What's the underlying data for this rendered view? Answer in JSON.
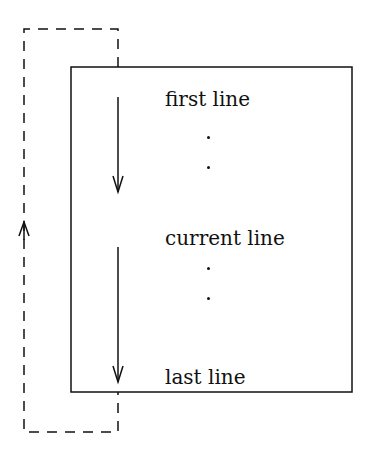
{
  "diagram": {
    "type": "buffer-scan-loop",
    "lines": {
      "first": "first line",
      "current": "current line",
      "last": "last line"
    },
    "ellipsis_dots": 4,
    "arrows": [
      {
        "name": "scan-down-first-to-current",
        "direction": "down"
      },
      {
        "name": "scan-down-current-to-last",
        "direction": "down"
      },
      {
        "name": "wrap-around-return",
        "direction": "up",
        "style": "dashed"
      }
    ],
    "colors": {
      "stroke": "#111111",
      "background": "#ffffff"
    }
  }
}
